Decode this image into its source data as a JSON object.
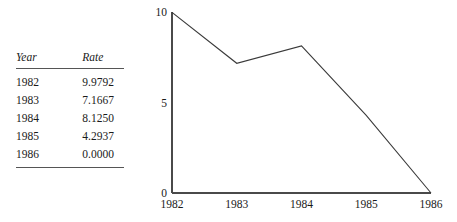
{
  "figure": {
    "background_color": "#ffffff",
    "ink_color": "#1a1a1a",
    "axis_color": "#4a4a4a",
    "line_color": "#3a3a3a"
  },
  "table": {
    "headers": [
      "Year",
      "Rate"
    ],
    "rows": [
      {
        "year": "1982",
        "rate": "9.9792"
      },
      {
        "year": "1983",
        "rate": "7.1667"
      },
      {
        "year": "1984",
        "rate": "8.1250"
      },
      {
        "year": "1985",
        "rate": "4.2937"
      },
      {
        "year": "1986",
        "rate": "0.0000"
      }
    ]
  },
  "chart_data": {
    "type": "line",
    "title": "",
    "xlabel": "",
    "ylabel": "",
    "x": [
      1982,
      1983,
      1984,
      1985,
      1986
    ],
    "categories": [
      "1982",
      "1983",
      "1984",
      "1985",
      "1986"
    ],
    "values": [
      9.9792,
      7.1667,
      8.125,
      4.2937,
      0.0
    ],
    "series": [
      {
        "name": "Rate",
        "values": [
          9.9792,
          7.1667,
          8.125,
          4.2937,
          0.0
        ]
      }
    ],
    "xlim": [
      1982,
      1986
    ],
    "ylim": [
      0,
      10
    ],
    "xticks": [
      "1982",
      "1983",
      "1984",
      "1985",
      "1986"
    ],
    "yticks": [
      "0",
      "5",
      "10"
    ],
    "ytick_values": [
      0,
      5,
      10
    ],
    "grid": false,
    "legend": false,
    "legend_position": "none"
  }
}
